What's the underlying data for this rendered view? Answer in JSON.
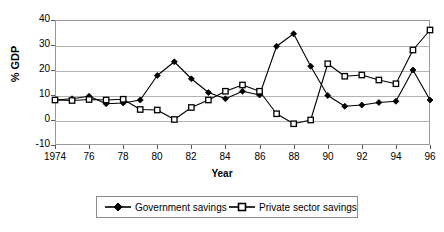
{
  "chart_data": {
    "type": "line",
    "title": "",
    "xlabel": "Year",
    "ylabel": "% GDP",
    "xlim": [
      1974,
      1996
    ],
    "ylim": [
      -10,
      40
    ],
    "yticks": [
      -10,
      0,
      10,
      20,
      30,
      40
    ],
    "ytick_labels": [
      "-10",
      "0",
      "10",
      "20",
      "30",
      "40"
    ],
    "xticks": [
      1974,
      1976,
      1978,
      1980,
      1982,
      1984,
      1986,
      1988,
      1990,
      1992,
      1994,
      1996
    ],
    "xtick_labels": [
      "1974",
      "76",
      "78",
      "80",
      "82",
      "84",
      "86",
      "88",
      "90",
      "92",
      "94",
      "96"
    ],
    "grid": "horizontal",
    "legend_position": "below-center",
    "x": [
      1974,
      1975,
      1976,
      1977,
      1978,
      1979,
      1980,
      1981,
      1982,
      1983,
      1984,
      1985,
      1986,
      1987,
      1988,
      1989,
      1990,
      1991,
      1992,
      1993,
      1994,
      1995,
      1996
    ],
    "series": [
      {
        "name": "Government savings",
        "marker": "filled-diamond",
        "color": "#000000",
        "values": [
          8.0,
          8.5,
          9.5,
          6.5,
          6.8,
          8.0,
          17.8,
          23.3,
          16.5,
          11.0,
          8.5,
          11.5,
          10.0,
          29.5,
          34.5,
          21.5,
          9.8,
          5.5,
          6.0,
          7.0,
          7.5,
          20.0,
          8.0
        ]
      },
      {
        "name": "Private sector savings",
        "marker": "open-square",
        "color": "#000000",
        "values": [
          8.0,
          7.8,
          8.2,
          8.0,
          8.3,
          4.2,
          4.0,
          0.2,
          5.0,
          8.0,
          11.5,
          14.0,
          11.5,
          2.5,
          -1.5,
          0.0,
          22.5,
          17.5,
          18.0,
          16.0,
          14.5,
          28.0,
          36.0
        ]
      }
    ]
  },
  "legend": {
    "items": [
      {
        "label": "Government savings",
        "marker": "filled-diamond"
      },
      {
        "label": "Private sector savings",
        "marker": "open-square"
      }
    ]
  },
  "colors": {
    "line": "#000000",
    "grid": "#b3b3b3",
    "frame": "#9a9a9a",
    "background": "#ffffff"
  }
}
